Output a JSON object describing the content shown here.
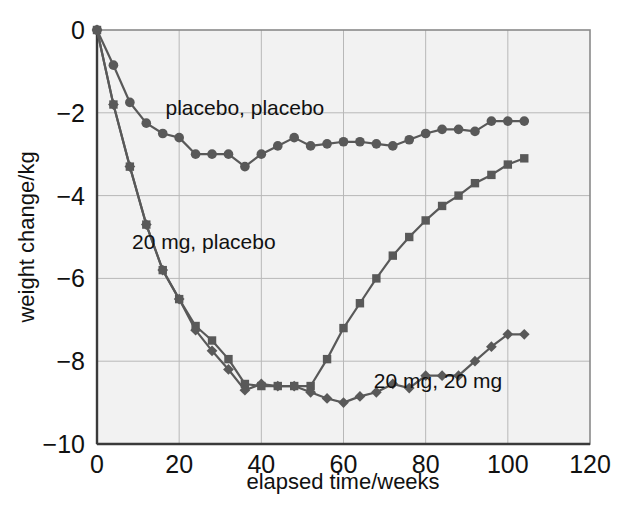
{
  "chart_data": {
    "type": "line",
    "title": "",
    "xlabel": "elapsed time/weeks",
    "ylabel": "weight change/kg",
    "xlim": [
      0,
      120
    ],
    "ylim": [
      -10,
      0
    ],
    "xticks": [
      0,
      20,
      40,
      60,
      80,
      100,
      120
    ],
    "xtick_labels": [
      "0",
      "20",
      "40",
      "60",
      "80",
      "100",
      "120"
    ],
    "yticks": [
      0,
      -2,
      -4,
      -6,
      -8,
      -10
    ],
    "ytick_labels": [
      "0",
      "−2",
      "−4",
      "−6",
      "−8",
      "−10"
    ],
    "grid": true,
    "legend_position": "inline-annotations",
    "plot_background": "#f2f2f2",
    "series_color": "#595959",
    "series": [
      {
        "name": "placebo, placebo",
        "marker": "circle",
        "annotation": "placebo, placebo",
        "annotation_x": 36,
        "annotation_y": -2.05,
        "x": [
          0,
          4,
          8,
          12,
          16,
          20,
          24,
          28,
          32,
          36,
          40,
          44,
          48,
          52,
          56,
          60,
          64,
          68,
          72,
          76,
          80,
          84,
          88,
          92,
          96,
          100,
          104
        ],
        "y": [
          0,
          -0.85,
          -1.75,
          -2.25,
          -2.5,
          -2.6,
          -3.0,
          -3.0,
          -3.0,
          -3.3,
          -3.0,
          -2.8,
          -2.6,
          -2.8,
          -2.75,
          -2.7,
          -2.7,
          -2.75,
          -2.8,
          -2.65,
          -2.5,
          -2.4,
          -2.4,
          -2.45,
          -2.2,
          -2.2,
          -2.2
        ]
      },
      {
        "name": "20 mg, placebo",
        "marker": "square",
        "annotation": "20 mg, placebo",
        "annotation_x": 26,
        "annotation_y": -5.3,
        "x": [
          0,
          4,
          8,
          12,
          16,
          20,
          24,
          28,
          32,
          36,
          40,
          44,
          48,
          52,
          56,
          60,
          64,
          68,
          72,
          76,
          80,
          84,
          88,
          92,
          96,
          100,
          104
        ],
        "y": [
          0,
          -1.8,
          -3.3,
          -4.7,
          -5.8,
          -6.5,
          -7.15,
          -7.5,
          -7.95,
          -8.55,
          -8.6,
          -8.6,
          -8.6,
          -8.6,
          -7.95,
          -7.2,
          -6.6,
          -6.0,
          -5.45,
          -5.0,
          -4.6,
          -4.25,
          -4.0,
          -3.7,
          -3.5,
          -3.25,
          -3.1
        ]
      },
      {
        "name": "20 mg, 20 mg",
        "marker": "diamond",
        "annotation": "20 mg, 20 mg",
        "annotation_x": 83,
        "annotation_y": -8.65,
        "x": [
          0,
          4,
          8,
          12,
          16,
          20,
          24,
          28,
          32,
          36,
          40,
          44,
          48,
          52,
          56,
          60,
          64,
          68,
          72,
          76,
          80,
          84,
          88,
          92,
          96,
          100,
          104
        ],
        "y": [
          0,
          -1.8,
          -3.3,
          -4.7,
          -5.8,
          -6.5,
          -7.25,
          -7.75,
          -8.2,
          -8.7,
          -8.55,
          -8.6,
          -8.6,
          -8.75,
          -8.9,
          -9.0,
          -8.85,
          -8.75,
          -8.55,
          -8.65,
          -8.35,
          -8.35,
          -8.35,
          -8.0,
          -7.65,
          -7.35,
          -7.35
        ]
      }
    ]
  }
}
